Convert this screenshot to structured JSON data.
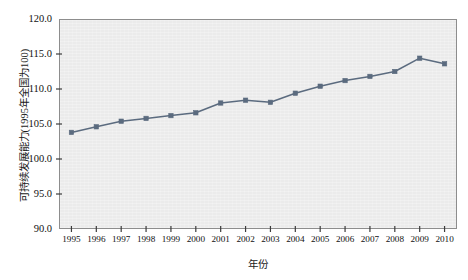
{
  "chart_data": {
    "type": "line",
    "title": "",
    "xlabel": "年份",
    "ylabel": "可持续发展能力(1995年全国为100)",
    "categories": [
      "1995",
      "1996",
      "1997",
      "1998",
      "1999",
      "2000",
      "2001",
      "2002",
      "2003",
      "2004",
      "2005",
      "2006",
      "2007",
      "2008",
      "2009",
      "2010"
    ],
    "x": [
      1995,
      1996,
      1997,
      1998,
      1999,
      2000,
      2001,
      2002,
      2003,
      2004,
      2005,
      2006,
      2007,
      2008,
      2009,
      2010
    ],
    "values": [
      103.8,
      104.6,
      105.4,
      105.8,
      106.2,
      106.6,
      108.0,
      108.4,
      108.1,
      109.4,
      110.4,
      111.2,
      111.8,
      112.5,
      114.4,
      113.6
    ],
    "series": [
      {
        "name": "可持续发展能力",
        "values": [
          103.8,
          104.6,
          105.4,
          105.8,
          106.2,
          106.6,
          108.0,
          108.4,
          108.1,
          109.4,
          110.4,
          111.2,
          111.8,
          112.5,
          114.4,
          113.6
        ]
      }
    ],
    "ylim": [
      90.0,
      120.0
    ],
    "yticks": [
      "120.0",
      "115.0",
      "110.0",
      "105.0",
      "100.0",
      "95.0",
      "90.0"
    ],
    "ytick_values": [
      120.0,
      115.0,
      110.0,
      105.0,
      100.0,
      95.0,
      90.0
    ],
    "xlim": [
      1994.5,
      2010.5
    ],
    "grid": false,
    "legend": "none",
    "colors": {
      "line": "#5b6b7f",
      "marker": "#5b6b7f",
      "plot_background": "#ebebeb",
      "axis": "#8d8d8d",
      "text": "#111111"
    }
  }
}
